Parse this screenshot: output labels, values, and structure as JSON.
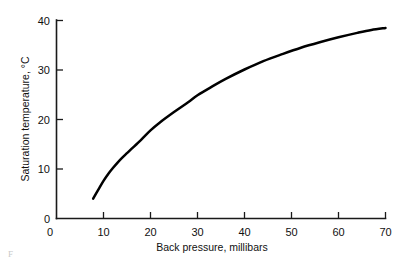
{
  "chart_data": {
    "type": "line",
    "title": "",
    "xlabel": "Back pressure, millibars",
    "ylabel": "Saturation temperature, °C",
    "xlim": [
      0,
      70
    ],
    "ylim": [
      0,
      40
    ],
    "xticks": [
      0,
      10,
      20,
      30,
      40,
      50,
      60,
      70
    ],
    "yticks": [
      0,
      10,
      20,
      30,
      40
    ],
    "xtick_labels": [
      "0",
      "10",
      "20",
      "30",
      "40",
      "50",
      "60",
      "70"
    ],
    "ytick_labels": [
      "0",
      "10",
      "20",
      "30",
      "40"
    ],
    "grid": false,
    "legend": false,
    "series": [
      {
        "name": "Saturation temperature",
        "color": "#000000",
        "x": [
          7.8,
          9,
          10,
          11,
          12,
          13,
          14,
          15,
          16,
          18,
          20,
          22,
          25,
          28,
          30,
          33,
          36,
          40,
          44,
          48,
          52,
          56,
          60,
          64,
          67,
          70
        ],
        "y": [
          4.0,
          6.0,
          7.6,
          9.0,
          10.2,
          11.3,
          12.3,
          13.2,
          14.1,
          15.9,
          17.8,
          19.4,
          21.5,
          23.5,
          24.9,
          26.6,
          28.2,
          30.1,
          31.8,
          33.2,
          34.5,
          35.6,
          36.6,
          37.5,
          38.1,
          38.5
        ]
      }
    ]
  },
  "axes": {
    "x_title": "Back pressure, millibars",
    "y_title": "Saturation temperature, °C",
    "x_labels": [
      "0",
      "10",
      "20",
      "30",
      "40",
      "50",
      "60",
      "70"
    ],
    "y_labels": [
      "0",
      "10",
      "20",
      "30",
      "40"
    ]
  },
  "caption": {
    "stub": "F"
  },
  "colors": {
    "curve": "#000000",
    "axis": "#1a1a1a",
    "background": "#ffffff",
    "text": "#111111"
  }
}
